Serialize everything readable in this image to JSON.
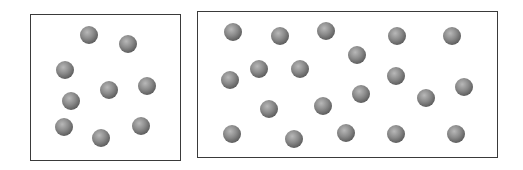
{
  "diagram": {
    "ball_color": "#8a8a8a",
    "ball_radius": 9,
    "containers": [
      {
        "name": "small-container",
        "rect": [
          30,
          14,
          151,
          147
        ],
        "particles": [
          [
            89,
            35
          ],
          [
            128,
            44
          ],
          [
            65,
            70
          ],
          [
            109,
            90
          ],
          [
            147,
            86
          ],
          [
            71,
            101
          ],
          [
            64,
            127
          ],
          [
            101,
            138
          ],
          [
            141,
            126
          ]
        ]
      },
      {
        "name": "large-container",
        "rect": [
          197,
          11,
          301,
          147
        ],
        "particles": [
          [
            233,
            32
          ],
          [
            280,
            36
          ],
          [
            326,
            31
          ],
          [
            259,
            69
          ],
          [
            300,
            69
          ],
          [
            230,
            80
          ],
          [
            269,
            109
          ],
          [
            323,
            106
          ],
          [
            232,
            134
          ],
          [
            294,
            139
          ],
          [
            346,
            133
          ],
          [
            397,
            36
          ],
          [
            452,
            36
          ],
          [
            357,
            55
          ],
          [
            396,
            76
          ],
          [
            361,
            94
          ],
          [
            426,
            98
          ],
          [
            464,
            87
          ],
          [
            396,
            134
          ],
          [
            456,
            134
          ]
        ]
      }
    ]
  }
}
